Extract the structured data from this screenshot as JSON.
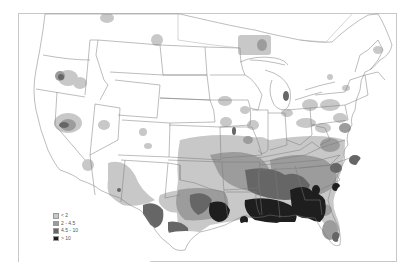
{
  "map": {
    "type": "choropleth",
    "region": "Contiguous United States",
    "colors": {
      "background": "#ffffff",
      "frame": "#c8c8c8",
      "boundary": "#7a7a7a",
      "class_1": "#c8c8c8",
      "class_2": "#9c9c9c",
      "class_3": "#666666",
      "class_4": "#1e1e1e"
    }
  },
  "legend": {
    "items": [
      {
        "label": "< 2",
        "color": "#c8c8c8"
      },
      {
        "label": "2 - 4.5",
        "color": "#9c9c9c"
      },
      {
        "label": "4.5 - 10",
        "color": "#666666"
      },
      {
        "label": "> 10",
        "color": "#1e1e1e"
      }
    ]
  }
}
